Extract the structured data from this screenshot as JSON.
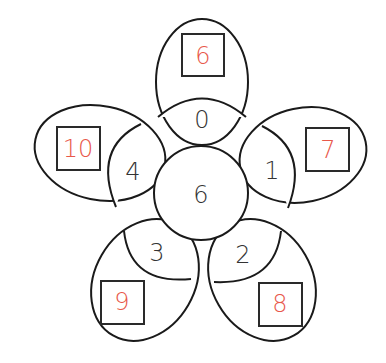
{
  "flower": {
    "center": {
      "value": "6"
    },
    "petals": [
      {
        "inner": "0",
        "outer": "6"
      },
      {
        "inner": "1",
        "outer": "7"
      },
      {
        "inner": "2",
        "outer": "8"
      },
      {
        "inner": "3",
        "outer": "9"
      },
      {
        "inner": "4",
        "outer": "10"
      }
    ]
  },
  "colors": {
    "answer": "#e8584a",
    "outline": "#1a1a1a",
    "text": "#333333"
  }
}
